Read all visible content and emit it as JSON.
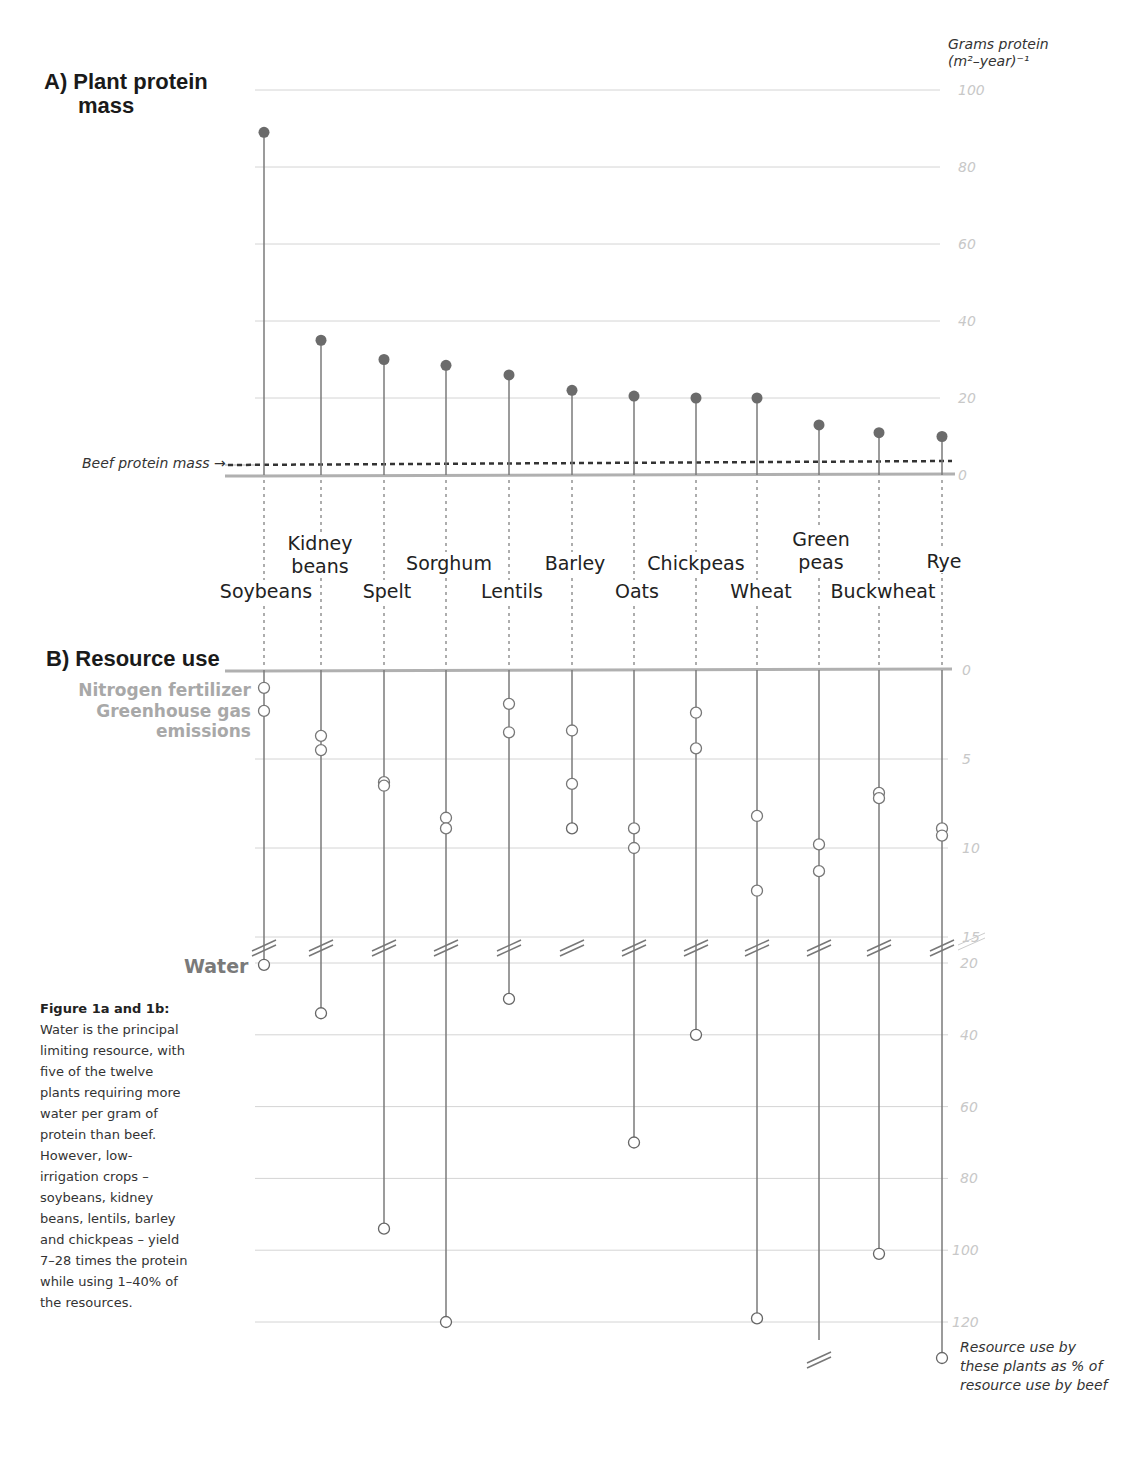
{
  "panel_a": {
    "title_line1": "A) Plant protein",
    "title_line2": "mass",
    "axis_title_line1": "Grams protein",
    "axis_title_line2": "(m²–year)⁻¹",
    "beef_label": "Beef protein mass →"
  },
  "panel_b": {
    "title": "B) Resource use",
    "legend_nitrogen": "Nitrogen fertilizer",
    "legend_ghg_line1": "Greenhouse gas",
    "legend_ghg_line2": "emissions",
    "legend_water": "Water",
    "note": "Resource use by these plants as % of resource use by beef"
  },
  "caption": {
    "heading": "Figure 1a and 1b:",
    "body": "Water is the principal limiting resource, with five of the twelve plants requiring more water per gram of protein than beef. However, low-irrigation crops – soybeans, kidney beans, lentils, barley and chickpeas – yield 7–28 times the protein while using 1–40% of the resources."
  },
  "crop_labels": [
    {
      "name": "Soybeans",
      "l1": "Soybeans",
      "l2": ""
    },
    {
      "name": "Kidney beans",
      "l1": "Kidney",
      "l2": "beans"
    },
    {
      "name": "Spelt",
      "l1": "Spelt",
      "l2": ""
    },
    {
      "name": "Sorghum",
      "l1": "Sorghum",
      "l2": ""
    },
    {
      "name": "Lentils",
      "l1": "Lentils",
      "l2": ""
    },
    {
      "name": "Barley",
      "l1": "Barley",
      "l2": ""
    },
    {
      "name": "Oats",
      "l1": "Oats",
      "l2": ""
    },
    {
      "name": "Chickpeas",
      "l1": "Chickpeas",
      "l2": ""
    },
    {
      "name": "Wheat",
      "l1": "Wheat",
      "l2": ""
    },
    {
      "name": "Green peas",
      "l1": "Green",
      "l2": "peas"
    },
    {
      "name": "Buckwheat",
      "l1": "Buckwheat",
      "l2": ""
    },
    {
      "name": "Rye",
      "l1": "Rye",
      "l2": ""
    }
  ],
  "colors": {
    "dot_fill": "#6b6b6b",
    "stem": "#7a7a7a",
    "grid": "#d4d4d4",
    "tick_label": "#c8c8c8",
    "axis_base": "#b0b0b0",
    "beef_line": "#333333"
  },
  "chart_data": [
    {
      "type": "lollipop",
      "title": "A) Plant protein mass",
      "ylabel": "Grams protein (m²–year)⁻¹",
      "ylim": [
        0,
        100
      ],
      "yticks": [
        0,
        20,
        40,
        60,
        80,
        100
      ],
      "grid": true,
      "categories": [
        "Soybeans",
        "Kidney beans",
        "Spelt",
        "Sorghum",
        "Lentils",
        "Barley",
        "Oats",
        "Chickpeas",
        "Wheat",
        "Green peas",
        "Buckwheat",
        "Rye"
      ],
      "values": [
        89,
        35,
        30,
        28.5,
        26,
        22,
        20.5,
        20,
        20,
        13,
        11,
        10
      ],
      "reference_line": {
        "label": "Beef protein mass",
        "value": 3
      }
    },
    {
      "type": "dot-stem",
      "title": "B) Resource use",
      "ylabel": "Resource use by these plants as % of resource use by beef",
      "axis_break": [
        15,
        20
      ],
      "yticks_upper": [
        0,
        5,
        10,
        15
      ],
      "yticks_lower": [
        20,
        40,
        60,
        80,
        100,
        120
      ],
      "grid": true,
      "categories": [
        "Soybeans",
        "Kidney beans",
        "Spelt",
        "Sorghum",
        "Lentils",
        "Barley",
        "Oats",
        "Chickpeas",
        "Wheat",
        "Green peas",
        "Buckwheat",
        "Rye"
      ],
      "series": [
        {
          "name": "Nitrogen fertilizer",
          "values": [
            1,
            3.7,
            6.3,
            8.3,
            1.9,
            3.4,
            8.9,
            2.4,
            8.2,
            9.8,
            6.9,
            8.9
          ]
        },
        {
          "name": "Greenhouse gas emissions",
          "values": [
            2.3,
            4.5,
            6.5,
            8.9,
            3.5,
            6.4,
            10,
            4.4,
            12.4,
            11.3,
            7.2,
            9.3
          ]
        },
        {
          "name": "Water",
          "values": [
            20.5,
            34,
            94,
            120,
            30,
            8.9,
            70,
            40,
            119,
            125,
            101,
            130
          ]
        }
      ]
    }
  ]
}
